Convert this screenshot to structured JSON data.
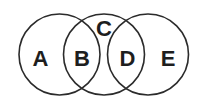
{
  "diagram": {
    "type": "venn",
    "circles": [
      {
        "id": "left",
        "cx": 59.5,
        "cy": 54.5,
        "r": 40.5
      },
      {
        "id": "middle",
        "cx": 104,
        "cy": 54.5,
        "r": 40.5
      },
      {
        "id": "right",
        "cx": 148,
        "cy": 54.5,
        "r": 40.5
      }
    ],
    "stroke_color": "#2b2b2b",
    "labels": [
      {
        "text": "A",
        "x": 40.5,
        "y": 66
      },
      {
        "text": "B",
        "x": 82,
        "y": 66
      },
      {
        "text": "C",
        "x": 104,
        "y": 36
      },
      {
        "text": "D",
        "x": 127.5,
        "y": 66
      },
      {
        "text": "E",
        "x": 168,
        "y": 66
      }
    ]
  }
}
